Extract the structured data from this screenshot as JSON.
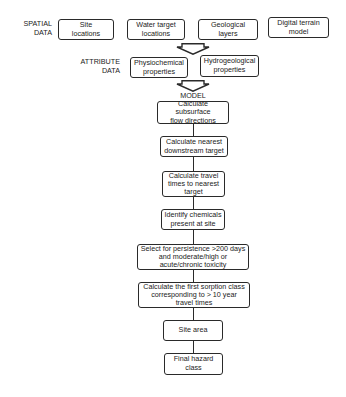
{
  "diagram": {
    "spatial": {
      "label": "SPATIAL\nDATA",
      "boxes": [
        {
          "text": "Site\nlocations"
        },
        {
          "text": "Water target\nlocations"
        },
        {
          "text": "Geological\nlayers"
        },
        {
          "text": "Digital terrain\nmodel"
        }
      ]
    },
    "attribute": {
      "label": "ATTRIBUTE\nDATA",
      "boxes": [
        {
          "text": "Physiochemical\nproperties"
        },
        {
          "text": "Hydrogeological\nproperties"
        }
      ]
    },
    "model": {
      "label": "MODEL",
      "steps": [
        {
          "text": "Calculate subsurface\nflow directions"
        },
        {
          "text": "Calculate nearest\ndownstream target"
        },
        {
          "text": "Calculate travel\ntimes to nearest\ntarget"
        },
        {
          "text": "Identify chemicals\npresent at site"
        },
        {
          "text": "Select for persistence >200 days\nand moderate/high or\nacute/chronic toxicity"
        },
        {
          "text": "Calculate the first sorption class\ncorresponding to > 10 year\ntravel times"
        },
        {
          "text": "Site area"
        },
        {
          "text": "Final hazard\nclass"
        }
      ]
    },
    "colors": {
      "stroke": "#2a2a2a",
      "background": "#ffffff",
      "text": "#222222"
    }
  }
}
